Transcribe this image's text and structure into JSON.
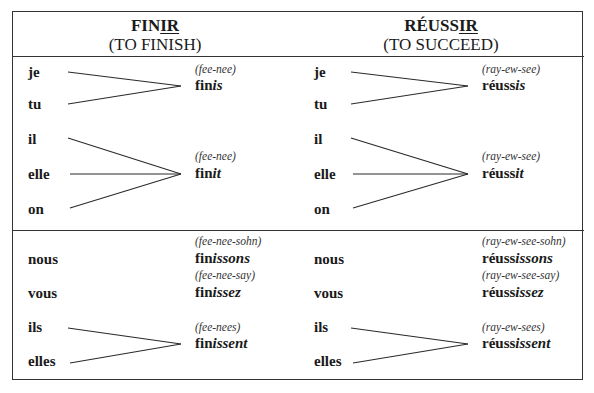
{
  "columns": [
    {
      "verb_stem": "FIN",
      "verb_ending": "IR",
      "gloss": "(TO FINISH)",
      "singular": {
        "group1": {
          "pronouns": [
            "je",
            "tu"
          ],
          "pronunciation": "(fee-nee)",
          "stem": "fin",
          "ending": "is"
        },
        "group2": {
          "pronouns": [
            "il",
            "elle",
            "on"
          ],
          "pronunciation": "(fee-nee)",
          "stem": "fin",
          "ending": "it"
        }
      },
      "plural": {
        "nous": {
          "pronoun": "nous",
          "pronunciation": "(fee-nee-sohn)",
          "stem": "fin",
          "ending": "issons"
        },
        "vous": {
          "pronoun": "vous",
          "pronunciation": "(fee-nee-say)",
          "stem": "fin",
          "ending": "issez"
        },
        "third": {
          "pronouns": [
            "ils",
            "elles"
          ],
          "pronunciation": "(fee-nees)",
          "stem": "fin",
          "ending": "issent"
        }
      }
    },
    {
      "verb_stem": "RÉUSS",
      "verb_ending": "IR",
      "gloss": "(TO SUCCEED)",
      "singular": {
        "group1": {
          "pronouns": [
            "je",
            "tu"
          ],
          "pronunciation": "(ray-ew-see)",
          "stem": "réuss",
          "ending": "is"
        },
        "group2": {
          "pronouns": [
            "il",
            "elle",
            "on"
          ],
          "pronunciation": "(ray-ew-see)",
          "stem": "réuss",
          "ending": "it"
        }
      },
      "plural": {
        "nous": {
          "pronoun": "nous",
          "pronunciation": "(ray-ew-see-sohn)",
          "stem": "réuss",
          "ending": "issons"
        },
        "vous": {
          "pronoun": "vous",
          "pronunciation": "(ray-ew-see-say)",
          "stem": "réuss",
          "ending": "issez"
        },
        "third": {
          "pronouns": [
            "ils",
            "elles"
          ],
          "pronunciation": "(ray-ew-sees)",
          "stem": "réuss",
          "ending": "issent"
        }
      }
    }
  ]
}
